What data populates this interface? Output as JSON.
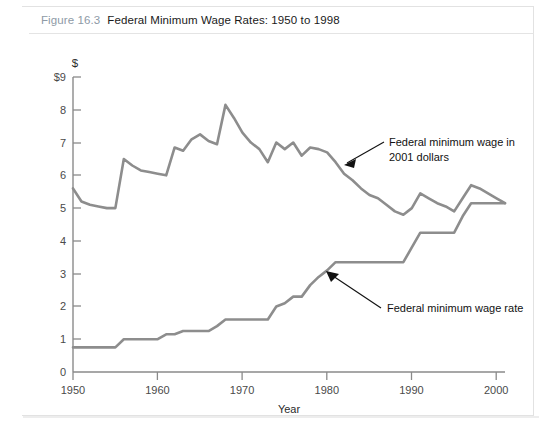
{
  "figure": {
    "number": "Figure 16.3",
    "title": "Federal Minimum Wage Rates: 1950 to 1998"
  },
  "axes": {
    "y_unit_symbol": "$",
    "y_top_label": "$9",
    "y_tick_labels": [
      "8",
      "7",
      "6",
      "5",
      "4",
      "3",
      "2",
      "1",
      "0"
    ],
    "x_tick_labels": [
      "1950",
      "1960",
      "1970",
      "1980",
      "1990",
      "2000"
    ],
    "x_axis_title": "Year"
  },
  "annotations": {
    "real_line_label_line1": "Federal minimum wage in",
    "real_line_label_line2": "2001 dollars",
    "nominal_line_label": "Federal minimum wage rate"
  },
  "colors": {
    "line": "#8d8d8d",
    "axis": "#8a8a8a",
    "figure_number": "#8e9aa6",
    "left_spine": "#9a9a9a"
  },
  "chart_data": {
    "type": "line",
    "title": "Federal Minimum Wage Rates: 1950 to 1998",
    "xlabel": "Year",
    "ylabel": "$",
    "xlim": [
      1950,
      2001
    ],
    "ylim": [
      0,
      9
    ],
    "xticks": [
      1950,
      1960,
      1970,
      1980,
      1990,
      2000
    ],
    "yticks": [
      0,
      1,
      2,
      3,
      4,
      5,
      6,
      7,
      8,
      9
    ],
    "grid": false,
    "legend": "annotations",
    "x": [
      1950,
      1951,
      1952,
      1953,
      1954,
      1955,
      1956,
      1957,
      1958,
      1959,
      1960,
      1961,
      1962,
      1963,
      1964,
      1965,
      1966,
      1967,
      1968,
      1969,
      1970,
      1971,
      1972,
      1973,
      1974,
      1975,
      1976,
      1977,
      1978,
      1979,
      1980,
      1981,
      1982,
      1983,
      1984,
      1985,
      1986,
      1987,
      1988,
      1989,
      1990,
      1991,
      1992,
      1993,
      1994,
      1995,
      1996,
      1997,
      1998,
      1999,
      2000,
      2001
    ],
    "series": [
      {
        "name": "Federal minimum wage in 2001 dollars",
        "values": [
          5.6,
          5.2,
          5.1,
          5.05,
          5.0,
          5.0,
          6.5,
          6.3,
          6.15,
          6.1,
          6.05,
          6.0,
          6.85,
          6.75,
          7.1,
          7.25,
          7.05,
          6.95,
          8.15,
          7.75,
          7.3,
          7.0,
          6.8,
          6.4,
          7.0,
          6.8,
          7.0,
          6.6,
          6.85,
          6.8,
          6.7,
          6.4,
          6.05,
          5.85,
          5.6,
          5.4,
          5.3,
          5.1,
          4.9,
          4.8,
          5.0,
          5.45,
          5.3,
          5.15,
          5.05,
          4.9,
          5.3,
          5.7,
          5.6,
          5.45,
          5.3,
          5.15
        ]
      },
      {
        "name": "Federal minimum wage rate",
        "values": [
          0.75,
          0.75,
          0.75,
          0.75,
          0.75,
          0.75,
          1.0,
          1.0,
          1.0,
          1.0,
          1.0,
          1.15,
          1.15,
          1.25,
          1.25,
          1.25,
          1.25,
          1.4,
          1.6,
          1.6,
          1.6,
          1.6,
          1.6,
          1.6,
          2.0,
          2.1,
          2.3,
          2.3,
          2.65,
          2.9,
          3.1,
          3.35,
          3.35,
          3.35,
          3.35,
          3.35,
          3.35,
          3.35,
          3.35,
          3.35,
          3.8,
          4.25,
          4.25,
          4.25,
          4.25,
          4.25,
          4.75,
          5.15,
          5.15,
          5.15,
          5.15,
          5.15
        ]
      }
    ]
  }
}
